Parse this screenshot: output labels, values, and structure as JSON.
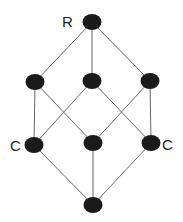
{
  "diagram": {
    "type": "lattice",
    "labels": {
      "top": "R",
      "left": "C",
      "right": "C"
    },
    "node_color": "#1a1a1a",
    "edge_color": "#666666",
    "nodes": [
      {
        "id": "top",
        "x": 92,
        "y": 22
      },
      {
        "id": "m1",
        "x": 35,
        "y": 82
      },
      {
        "id": "m2",
        "x": 92,
        "y": 81
      },
      {
        "id": "m3",
        "x": 150,
        "y": 81
      },
      {
        "id": "l1",
        "x": 34,
        "y": 145
      },
      {
        "id": "l2",
        "x": 93,
        "y": 143
      },
      {
        "id": "l3",
        "x": 151,
        "y": 143
      },
      {
        "id": "bottom",
        "x": 93,
        "y": 205
      }
    ],
    "edges": [
      [
        "top",
        "m1"
      ],
      [
        "top",
        "m2"
      ],
      [
        "top",
        "m3"
      ],
      [
        "m1",
        "l1"
      ],
      [
        "m1",
        "l2"
      ],
      [
        "m2",
        "l1"
      ],
      [
        "m2",
        "l3"
      ],
      [
        "m3",
        "l2"
      ],
      [
        "m3",
        "l3"
      ],
      [
        "l1",
        "bottom"
      ],
      [
        "l2",
        "bottom"
      ],
      [
        "l3",
        "bottom"
      ]
    ]
  }
}
